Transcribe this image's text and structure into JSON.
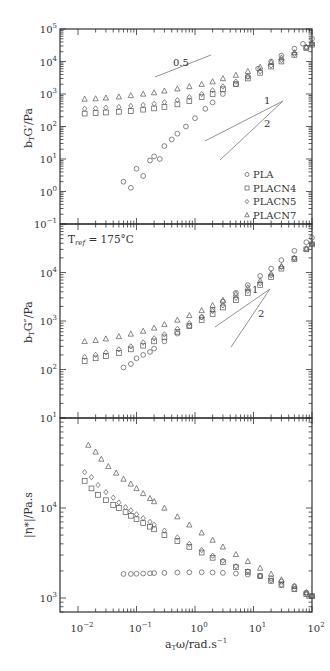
{
  "chart_data": [
    {
      "type": "scatter",
      "panel": "top",
      "ylabel": "b_T G'/Pa",
      "xscale": "log",
      "yscale": "log",
      "xlim": [
        0.01,
        100
      ],
      "ylim": [
        0.1,
        100000
      ],
      "ytick_labels": [
        "10^-1",
        "10^0",
        "10^1",
        "10^2",
        "10^3",
        "10^4",
        "10^5"
      ],
      "annotations": [
        {
          "text": "0.5",
          "type": "slope-line"
        },
        {
          "text": "1",
          "type": "slope-line"
        },
        {
          "text": "2",
          "type": "slope-line"
        }
      ],
      "legend": {
        "position": "lower right",
        "entries": [
          {
            "name": "PLA",
            "marker": "circle"
          },
          {
            "name": "PLACN4",
            "marker": "square"
          },
          {
            "name": "PLACN5",
            "marker": "diamond"
          },
          {
            "name": "PLACN7",
            "marker": "triangle"
          }
        ]
      },
      "series": [
        {
          "name": "PLA",
          "marker": "circle",
          "x": [
            0.06,
            0.08,
            0.1,
            0.13,
            0.17,
            0.2,
            0.25,
            0.3,
            0.4,
            0.5,
            0.7,
            1,
            1.5,
            2,
            3,
            5,
            8,
            12,
            20,
            30,
            50,
            70,
            100
          ],
          "y": [
            2,
            1.3,
            5,
            3,
            9,
            12,
            10,
            25,
            40,
            60,
            100,
            180,
            350,
            550,
            1000,
            2000,
            3500,
            6000,
            10000,
            15000,
            25000,
            35000,
            50000
          ]
        },
        {
          "name": "PLACN4",
          "marker": "square",
          "x": [
            0.013,
            0.02,
            0.03,
            0.05,
            0.08,
            0.13,
            0.2,
            0.3,
            0.5,
            0.8,
            1.3,
            2,
            3,
            5,
            8,
            13,
            20,
            30,
            50,
            80,
            100
          ],
          "y": [
            250,
            260,
            270,
            285,
            300,
            330,
            360,
            400,
            480,
            600,
            800,
            1000,
            1400,
            2000,
            3000,
            4500,
            7000,
            10000,
            16000,
            26000,
            33000
          ]
        },
        {
          "name": "PLACN5",
          "marker": "diamond",
          "x": [
            0.013,
            0.02,
            0.03,
            0.05,
            0.08,
            0.13,
            0.2,
            0.3,
            0.5,
            0.8,
            1.3,
            2,
            3,
            5,
            8,
            13,
            20,
            30,
            50,
            80,
            100
          ],
          "y": [
            350,
            360,
            380,
            400,
            430,
            460,
            500,
            560,
            650,
            800,
            1000,
            1300,
            1700,
            2400,
            3400,
            5000,
            7500,
            11000,
            17000,
            27000,
            35000
          ]
        },
        {
          "name": "PLACN7",
          "marker": "triangle",
          "x": [
            0.013,
            0.02,
            0.03,
            0.05,
            0.08,
            0.13,
            0.2,
            0.3,
            0.5,
            0.8,
            1.3,
            2,
            3,
            5,
            8,
            13,
            20,
            30,
            50,
            80,
            100
          ],
          "y": [
            700,
            720,
            760,
            820,
            900,
            1000,
            1100,
            1250,
            1450,
            1700,
            2000,
            2400,
            3000,
            3800,
            5000,
            6800,
            9500,
            13000,
            19000,
            28000,
            36000
          ]
        }
      ]
    },
    {
      "type": "scatter",
      "panel": "middle",
      "ylabel": "b_T G''/Pa",
      "xscale": "log",
      "yscale": "log",
      "xlim": [
        0.01,
        100
      ],
      "ylim": [
        10,
        100000
      ],
      "ytick_labels": [
        "10^1",
        "10^2",
        "10^3",
        "10^4",
        "10^5"
      ],
      "annotations": [
        {
          "text": "T_ref = 175°C",
          "type": "label"
        },
        {
          "text": "1",
          "type": "slope-line"
        },
        {
          "text": "2",
          "type": "slope-line"
        }
      ],
      "series": [
        {
          "name": "PLA",
          "marker": "circle",
          "x": [
            0.06,
            0.08,
            0.1,
            0.13,
            0.17,
            0.2,
            0.3,
            0.5,
            0.8,
            1.3,
            2,
            3,
            5,
            8,
            13,
            20,
            30,
            50,
            80,
            100
          ],
          "y": [
            110,
            130,
            170,
            200,
            230,
            270,
            380,
            550,
            800,
            1200,
            1700,
            2500,
            3800,
            5500,
            8500,
            12000,
            18000,
            28000,
            42000,
            52000
          ]
        },
        {
          "name": "PLACN4",
          "marker": "square",
          "x": [
            0.013,
            0.02,
            0.03,
            0.05,
            0.08,
            0.13,
            0.2,
            0.3,
            0.5,
            0.8,
            1.3,
            2,
            3,
            5,
            8,
            13,
            20,
            30,
            50,
            80,
            100
          ],
          "y": [
            150,
            170,
            190,
            220,
            260,
            310,
            380,
            460,
            600,
            780,
            1050,
            1400,
            1900,
            2700,
            3800,
            5500,
            8000,
            12000,
            19000,
            30000,
            38000
          ]
        },
        {
          "name": "PLACN5",
          "marker": "diamond",
          "x": [
            0.013,
            0.02,
            0.03,
            0.05,
            0.08,
            0.13,
            0.2,
            0.3,
            0.5,
            0.8,
            1.3,
            2,
            3,
            5,
            8,
            13,
            20,
            30,
            50,
            80,
            100
          ],
          "y": [
            180,
            200,
            225,
            260,
            300,
            360,
            440,
            530,
            690,
            900,
            1200,
            1600,
            2100,
            3000,
            4200,
            6000,
            8700,
            13000,
            20000,
            31000,
            39000
          ]
        },
        {
          "name": "PLACN7",
          "marker": "triangle",
          "x": [
            0.013,
            0.02,
            0.03,
            0.05,
            0.08,
            0.13,
            0.2,
            0.3,
            0.5,
            0.8,
            1.3,
            2,
            3,
            5,
            8,
            13,
            20,
            30,
            50,
            80,
            100
          ],
          "y": [
            380,
            400,
            430,
            480,
            540,
            620,
            720,
            850,
            1050,
            1300,
            1650,
            2100,
            2700,
            3600,
            4900,
            6800,
            9500,
            13500,
            20000,
            31000,
            40000
          ]
        }
      ]
    },
    {
      "type": "scatter",
      "panel": "bottom",
      "ylabel": "|η*|/Pa.s",
      "xlabel": "a_T ω/rad.s^-1",
      "xscale": "log",
      "yscale": "log",
      "xlim": [
        0.01,
        100
      ],
      "ylim": [
        700,
        100000
      ],
      "xtick_labels": [
        "10^-2",
        "10^-1",
        "10^0",
        "10^1",
        "10^2"
      ],
      "ytick_labels": [
        "10^3",
        "10^4"
      ],
      "series": [
        {
          "name": "PLA",
          "marker": "circle",
          "x": [
            0.06,
            0.08,
            0.1,
            0.13,
            0.17,
            0.2,
            0.3,
            0.5,
            0.8,
            1.3,
            2,
            3,
            5,
            8,
            13,
            20,
            30,
            50,
            80,
            100
          ],
          "y": [
            1850,
            1850,
            1860,
            1870,
            1880,
            1890,
            1900,
            1920,
            1930,
            1930,
            1920,
            1900,
            1870,
            1820,
            1750,
            1650,
            1520,
            1350,
            1150,
            1050
          ]
        },
        {
          "name": "PLACN4",
          "marker": "square",
          "x": [
            0.013,
            0.017,
            0.022,
            0.03,
            0.04,
            0.05,
            0.065,
            0.08,
            0.1,
            0.13,
            0.17,
            0.2,
            0.3,
            0.5,
            0.8,
            1.3,
            2,
            3,
            5,
            8,
            13,
            20,
            30,
            50,
            80,
            100
          ],
          "y": [
            20000,
            16500,
            14000,
            12200,
            10800,
            10000,
            9000,
            8200,
            7500,
            6800,
            6200,
            5800,
            5000,
            4300,
            3700,
            3200,
            2800,
            2500,
            2200,
            1950,
            1750,
            1550,
            1400,
            1250,
            1100,
            1050
          ]
        },
        {
          "name": "PLACN5",
          "marker": "diamond",
          "x": [
            0.013,
            0.017,
            0.022,
            0.03,
            0.04,
            0.05,
            0.065,
            0.08,
            0.1,
            0.13,
            0.17,
            0.2,
            0.3,
            0.5,
            0.8,
            1.3,
            2,
            3,
            5,
            8,
            13,
            20,
            30,
            50,
            80,
            100
          ],
          "y": [
            25000,
            22000,
            18000,
            15000,
            13000,
            11500,
            10200,
            9400,
            8500,
            7700,
            7000,
            6500,
            5600,
            4700,
            4000,
            3400,
            2950,
            2600,
            2250,
            1980,
            1760,
            1560,
            1400,
            1250,
            1100,
            1050
          ]
        },
        {
          "name": "PLACN7",
          "marker": "triangle",
          "x": [
            0.015,
            0.02,
            0.025,
            0.033,
            0.045,
            0.06,
            0.08,
            0.1,
            0.13,
            0.17,
            0.2,
            0.3,
            0.5,
            0.8,
            1.3,
            2,
            3,
            5,
            8,
            13,
            20,
            30,
            50,
            80,
            100
          ],
          "y": [
            50000,
            42000,
            35000,
            29000,
            24500,
            21000,
            18500,
            16500,
            14500,
            12800,
            11800,
            10000,
            8000,
            6500,
            5300,
            4400,
            3700,
            3050,
            2550,
            2150,
            1850,
            1600,
            1350,
            1150,
            1050
          ]
        }
      ]
    }
  ],
  "labels": {
    "top_ylabel": "b",
    "top_ylabel_sub": "T",
    "top_ylabel_rest": "G′/Pa",
    "mid_ylabel": "b",
    "mid_ylabel_sub": "T",
    "mid_ylabel_rest": "G″/Pa",
    "bot_ylabel": "|η*|/Pa.s",
    "xlabel_main": "a",
    "xlabel_sub": "T",
    "xlabel_rest": "ω/rad.s",
    "xlabel_sup": "−1",
    "tref_main": "T",
    "tref_sub": "ref",
    "tref_rest": " = 175°C",
    "slope_05": "0.5",
    "slope_1": "1",
    "slope_2": "2",
    "legend": [
      "PLA",
      "PLACN4",
      "PLACN5",
      "PLACN7"
    ]
  },
  "colors": {
    "axis": "#333333",
    "marker": "#555555",
    "guide": "#777777"
  }
}
